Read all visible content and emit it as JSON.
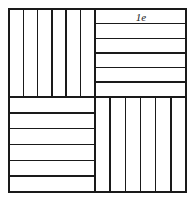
{
  "figure": {
    "background_color": "#ffffff",
    "stroke_color": "#1a1a1a",
    "frame": {
      "x": 9,
      "y": 9,
      "width": 177,
      "height": 183,
      "stroke_width": 1.6
    },
    "split": {
      "vertical_x": 95,
      "horizontal_y": 97,
      "stroke_width": 1.6
    },
    "annotation": {
      "label": "1e",
      "x": 141,
      "y": 21,
      "font_size": 11,
      "font_style": "italic",
      "color": "#1a1a1a"
    },
    "quadrants": [
      {
        "name": "top-left",
        "orientation": "vertical",
        "x": 9,
        "y": 9,
        "width": 86,
        "height": 88,
        "stripe_count": 6,
        "stripe_positions": [
          23.3,
          37.6,
          51.9,
          66.2,
          80.5
        ],
        "stripe_width": 1.5
      },
      {
        "name": "top-right",
        "orientation": "horizontal",
        "x": 95,
        "y": 9,
        "width": 91,
        "height": 88,
        "stripe_count": 6,
        "stripe_positions": [
          23.6,
          38.3,
          52.9,
          67.6,
          82.2
        ],
        "stripe_width": 1.5
      },
      {
        "name": "bottom-left",
        "orientation": "horizontal",
        "x": 9,
        "y": 97,
        "width": 86,
        "height": 95,
        "stripe_count": 6,
        "stripe_positions": [
          112.8,
          128.7,
          144.5,
          160.3,
          176.2
        ],
        "stripe_width": 1.5
      },
      {
        "name": "bottom-right",
        "orientation": "vertical",
        "x": 95,
        "y": 97,
        "width": 91,
        "height": 95,
        "stripe_count": 6,
        "stripe_positions": [
          110.2,
          125.3,
          140.5,
          155.7,
          170.8
        ],
        "stripe_width": 1.5
      }
    ]
  }
}
